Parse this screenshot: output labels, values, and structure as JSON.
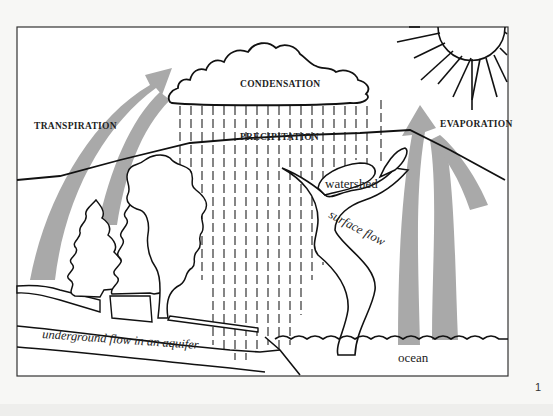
{
  "diagram": {
    "labels": {
      "condensation": "CONDENSATION",
      "precipitation": "PRECIPITATION",
      "transpiration": "TRANSPIRATION",
      "evaporation": "EVAPORATION",
      "watershed": "watershed",
      "surface_flow": "surface flow",
      "underground_flow": "underground flow in an aquifer",
      "ocean": "ocean"
    },
    "page_number": "1",
    "colors": {
      "line": "#111111",
      "arrow": "#a9a9a9",
      "background": "#ffffff",
      "page": "#f7f7f5"
    },
    "elements": [
      "cloud",
      "sun",
      "rain",
      "trees",
      "hills",
      "river",
      "aquifer",
      "ocean",
      "transpiration-arrows",
      "evaporation-arrows"
    ]
  }
}
